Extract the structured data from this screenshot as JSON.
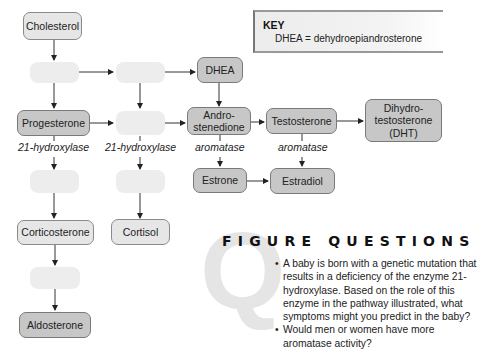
{
  "key": {
    "title": "KEY",
    "entry": "DHEA = dehydroepiandrosterone"
  },
  "nodes": {
    "cholesterol": "Cholesterol",
    "dhea": "DHEA",
    "progesterone": "Progesterone",
    "androstenedione_line1": "Andro-",
    "androstenedione_line2": "stenedione",
    "testosterone": "Testosterone",
    "dht_line1": "Dihydro-",
    "dht_line2": "testosterone",
    "dht_line3": "(DHT)",
    "estrone": "Estrone",
    "estradiol": "Estradiol",
    "corticosterone": "Corticosterone",
    "cortisol": "Cortisol",
    "aldosterone": "Aldosterone"
  },
  "enzymes": {
    "hydroxylase_1": "21-hydroxylase",
    "hydroxylase_2": "21-hydroxylase",
    "aromatase_1": "aromatase",
    "aromatase_2": "aromatase"
  },
  "figure_questions": {
    "watermark": "Q",
    "title": "FIGURE QUESTIONS",
    "items": [
      "A baby is born with a genetic mutation that results in a deficiency of the enzyme 21-hydroxylase. Based on the role of this enzyme in the pathway illustrated, what symptoms might you predict in the baby?",
      "Would men or women have more aromatase activity?"
    ]
  }
}
